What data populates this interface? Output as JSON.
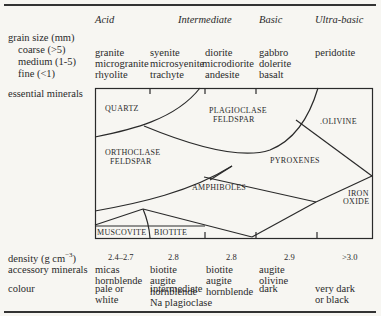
{
  "header": {
    "columns": [
      "Acid",
      "Intermediate",
      "Basic",
      "Ultra-basic"
    ]
  },
  "rows": {
    "grain_size": {
      "label": "grain size (mm)",
      "sub": [
        {
          "label": "coarse (>5)",
          "values": [
            "granite",
            "syenite",
            "diorite",
            "gabbro",
            "peridotite"
          ]
        },
        {
          "label": "medium (1-5)",
          "values": [
            "microgranite",
            "microsyenite",
            "microdiorite",
            "dolerite",
            ""
          ]
        },
        {
          "label": "fine (<1)",
          "values": [
            "rhyolite",
            "trachyte",
            "andesite",
            "basalt",
            ""
          ]
        }
      ]
    },
    "essential_minerals": {
      "label": "essential minerals",
      "regions": [
        "QUARTZ",
        "PLAGIOCLASE",
        "FELDSPAR",
        "ORTHOCLASE",
        "FELDSPAR",
        ".OLIVINE",
        "PYROXENES",
        "AMPHIBOLES",
        "IRON",
        "OXIDE",
        "MUSCOVITE",
        "BIOTITE"
      ]
    },
    "density": {
      "label": "density (g cm",
      "label_sup": "−3",
      "label_end": ")",
      "values": [
        "2.4–2.7",
        "2.8",
        "2.8",
        "2.9",
        ">3.0"
      ]
    },
    "accessory": {
      "label": "accessory minerals",
      "values": [
        [
          "micas",
          "hornblende"
        ],
        [
          "biotite",
          "augite",
          "hornblende",
          "Na plagioclase"
        ],
        [
          "biotite",
          "augite",
          "hornblende"
        ],
        [
          "augite",
          "olivine"
        ]
      ]
    },
    "colour": {
      "label": "colour",
      "values": [
        [
          "pale or",
          "white"
        ],
        [
          "intermediate"
        ],
        [
          "dark"
        ],
        [
          "very dark",
          "or black"
        ]
      ]
    }
  }
}
